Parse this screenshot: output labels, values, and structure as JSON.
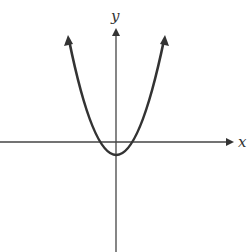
{
  "figure": {
    "type": "graph of parabola",
    "axes": {
      "x_label": "x",
      "y_label": "y"
    },
    "curve": {
      "shape": "upward-opening parabola",
      "vertex": "slightly below origin on y-axis",
      "x_intercepts": "two, one on each side of the y-axis near the origin",
      "ends": "arrows pointing upward on both sides"
    },
    "colors": {
      "stroke": "#333333",
      "background": "#ffffff"
    }
  }
}
